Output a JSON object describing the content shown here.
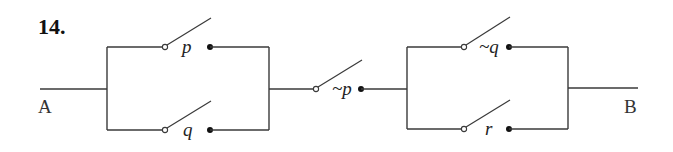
{
  "problem_number": "14.",
  "terminals": {
    "start": "A",
    "end": "B"
  },
  "switches": {
    "p": "p",
    "q": "q",
    "not_p": "~p",
    "not_q": "~q",
    "r": "r"
  },
  "structure": "(p OR q) AND ~p AND (~q OR r)",
  "colors": {
    "line": "#3a3a3a",
    "background": "#ffffff"
  }
}
